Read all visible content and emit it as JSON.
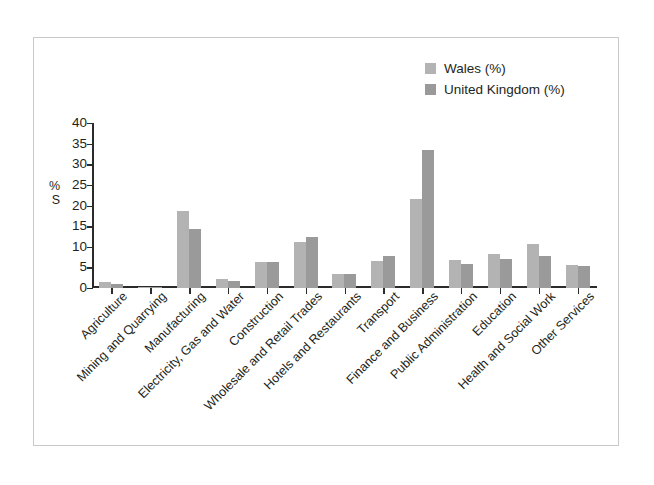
{
  "figure": {
    "frame_border_color": "#c9c9c9",
    "background": "#ffffff"
  },
  "legend": {
    "position": "top-right",
    "entries": [
      {
        "label": "Wales (%)",
        "color": "#b3b3b3",
        "swatch_name": "legend-swatch-wales"
      },
      {
        "label": "United Kingdom (%)",
        "color": "#9a9a9a",
        "swatch_name": "legend-swatch-uk"
      }
    ]
  },
  "axes": {
    "ylabel_line1": "%",
    "ylabel_line2": "S",
    "yticks": [
      "40",
      "35",
      "30",
      "25",
      "20",
      "15",
      "10",
      "5",
      "0"
    ],
    "ymin": 0,
    "ymax": 40,
    "ystep": 5,
    "axis_color": "#2b2b2b"
  },
  "chart_data": {
    "type": "bar",
    "title": "",
    "xlabel": "",
    "ylabel": "% S",
    "ylim": [
      0,
      40
    ],
    "ystep": 5,
    "grid": false,
    "legend_position": "top-right",
    "categories": [
      "Agriculture",
      "Mining and Quarrying",
      "Manufacturing",
      "Electricity, Gas and Water",
      "Construction",
      "Wholesale and Retail Trades",
      "Hotels and Restaurants",
      "Transport",
      "Finance and Business",
      "Public Administration",
      "Education",
      "Health and Social Work",
      "Other Services"
    ],
    "series": [
      {
        "name": "Wales (%)",
        "color": "#b3b3b3",
        "values": [
          1.5,
          0.2,
          18.7,
          2.1,
          6.4,
          11.2,
          3.5,
          6.5,
          21.5,
          6.8,
          8.2,
          10.7,
          5.5
        ]
      },
      {
        "name": "United Kingdom (%)",
        "color": "#9a9a9a",
        "values": [
          1.0,
          0.2,
          14.2,
          1.7,
          6.3,
          12.4,
          3.3,
          7.7,
          33.5,
          5.8,
          7.0,
          7.8,
          5.4
        ]
      }
    ]
  }
}
